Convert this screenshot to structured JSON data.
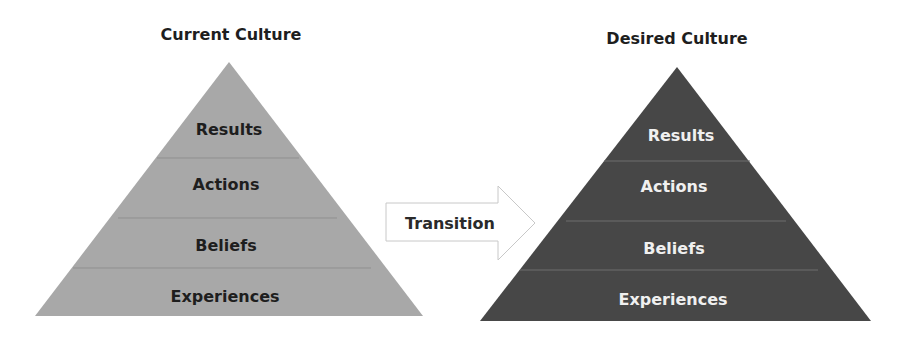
{
  "diagram": {
    "current": {
      "title": "Current Culture",
      "fill": "#a8a8a8",
      "divider": "#8c8c8c",
      "text_color": "#1e1e1e",
      "layers": [
        {
          "label": "Results"
        },
        {
          "label": "Actions"
        },
        {
          "label": "Beliefs"
        },
        {
          "label": "Experiences"
        }
      ]
    },
    "transition": {
      "label": "Transition",
      "stroke": "#c8c8c8",
      "fill": "#ffffff"
    },
    "desired": {
      "title": "Desired Culture",
      "fill": "#474747",
      "divider": "#6a6a6a",
      "text_color": "#f0f0f0",
      "layers": [
        {
          "label": "Results"
        },
        {
          "label": "Actions"
        },
        {
          "label": "Beliefs"
        },
        {
          "label": "Experiences"
        }
      ]
    }
  }
}
